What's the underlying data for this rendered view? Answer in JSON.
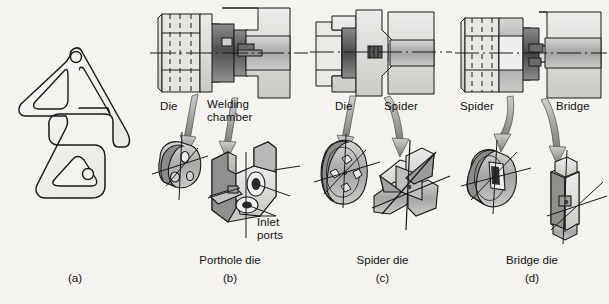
{
  "figure": {
    "background_color": "#f4f3ef",
    "line_color": "#1a1a1a"
  },
  "panels": [
    {
      "id": "a",
      "letter": "(a)",
      "caption": "",
      "description": "Extruded hollow aluminum profile cross-section",
      "labels": []
    },
    {
      "id": "b",
      "letter": "(b)",
      "caption": "Porthole die",
      "description": "Sectional view of porthole die assembly with exploded die plate and welding chamber",
      "labels": [
        {
          "name": "die",
          "text": "Die"
        },
        {
          "name": "welding-chamber",
          "text": "Welding\nchamber"
        },
        {
          "name": "inlet-ports",
          "text": "Inlet\nports"
        }
      ]
    },
    {
      "id": "c",
      "letter": "(c)",
      "caption": "Spider die",
      "description": "Sectional view of spider die assembly with exploded die plate and four-leg spider mandrel",
      "labels": [
        {
          "name": "die",
          "text": "Die"
        },
        {
          "name": "spider",
          "text": "Spider"
        }
      ]
    },
    {
      "id": "d",
      "letter": "(d)",
      "caption": "Bridge die",
      "description": "Sectional view of bridge die assembly with exploded spider ring and bridge mandrel",
      "labels": [
        {
          "name": "spider",
          "text": "Spider"
        },
        {
          "name": "bridge",
          "text": "Bridge"
        }
      ]
    }
  ]
}
